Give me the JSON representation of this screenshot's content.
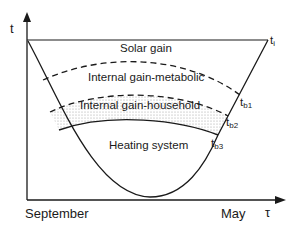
{
  "diagram": {
    "axes": {
      "y_label": "t",
      "x_label": "τ",
      "x_start_label": "September",
      "x_end_label": "May"
    },
    "regions": [
      {
        "label": "Solar gain"
      },
      {
        "label": "Internal gain-metabolic"
      },
      {
        "label": "Internal gain-household"
      },
      {
        "label": "Heating system"
      }
    ],
    "points": {
      "ti": {
        "base": "t",
        "sub": "i"
      },
      "tb1": {
        "base": "t",
        "sub": "b1"
      },
      "tb2": {
        "base": "t",
        "sub": "b2"
      },
      "tb3": {
        "base": "t",
        "sub": "b3"
      }
    },
    "colors": {
      "line": "#1a1a1a",
      "dots": "#9a9a9a"
    }
  }
}
